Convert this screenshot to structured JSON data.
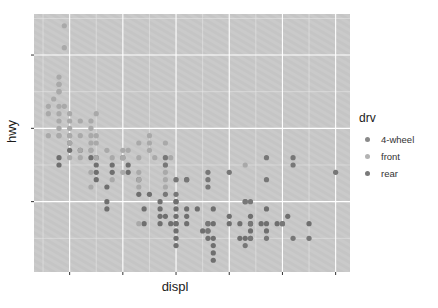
{
  "chart_data": {
    "type": "scatter",
    "title": "",
    "xlabel": "displ",
    "ylabel": "hwy",
    "xlim": [
      1.33,
      7.27
    ],
    "ylim": [
      10.4,
      45.6
    ],
    "x_major_breaks": [
      2,
      3,
      4,
      5,
      6,
      7
    ],
    "x_minor_breaks": [
      1.5,
      2.5,
      3.5,
      4.5,
      5.5,
      6.5
    ],
    "y_major_breaks": [
      20,
      30,
      40
    ],
    "y_minor_breaks": [
      15,
      25,
      35,
      45
    ],
    "tick_labels_visible": false,
    "grid": true,
    "legend_position": "right",
    "legend": {
      "title": "drv",
      "entries": [
        {
          "key": "4",
          "label": "4-wheel",
          "color": "#8a8a8a"
        },
        {
          "key": "f",
          "label": "front",
          "color": "#b3b3b3"
        },
        {
          "key": "r",
          "label": "rear",
          "color": "#7a7a7a"
        }
      ]
    },
    "point_colors": {
      "4": "#6f6f6f",
      "f": "#a9a9a9",
      "r": "#777777"
    },
    "series": [
      {
        "name": "4-wheel",
        "drv": "4",
        "points": [
          [
            1.8,
            26
          ],
          [
            1.8,
            25
          ],
          [
            2.0,
            28
          ],
          [
            2.0,
            27
          ],
          [
            2.8,
            25
          ],
          [
            3.1,
            25
          ],
          [
            2.8,
            24
          ],
          [
            3.1,
            24
          ],
          [
            4.2,
            23
          ],
          [
            5.3,
            20
          ],
          [
            5.3,
            15
          ],
          [
            5.7,
            17
          ],
          [
            6.5,
            17
          ],
          [
            3.7,
            19
          ],
          [
            3.7,
            18
          ],
          [
            3.9,
            17
          ],
          [
            4.7,
            17
          ],
          [
            4.7,
            19
          ],
          [
            5.2,
            17
          ],
          [
            5.7,
            19
          ],
          [
            5.9,
            17
          ],
          [
            4.7,
            12
          ],
          [
            5.2,
            15
          ],
          [
            3.7,
            17
          ],
          [
            4.0,
            17
          ],
          [
            4.7,
            15
          ],
          [
            5.7,
            16
          ],
          [
            6.1,
            18
          ],
          [
            4.6,
            17
          ],
          [
            5.4,
            17
          ],
          [
            5.4,
            15
          ],
          [
            4.0,
            20
          ],
          [
            4.0,
            19
          ],
          [
            4.6,
            15
          ],
          [
            5.0,
            17
          ],
          [
            4.2,
            17
          ],
          [
            4.2,
            19
          ],
          [
            4.6,
            16
          ],
          [
            5.4,
            16
          ],
          [
            2.4,
            26
          ],
          [
            3.0,
            26
          ],
          [
            3.3,
            21
          ],
          [
            3.3,
            23
          ],
          [
            4.2,
            18
          ],
          [
            4.4,
            19
          ],
          [
            5.0,
            18
          ],
          [
            5.4,
            18
          ],
          [
            2.5,
            26
          ],
          [
            2.5,
            25
          ],
          [
            2.5,
            24
          ],
          [
            2.5,
            23
          ],
          [
            2.2,
            27
          ],
          [
            2.7,
            20
          ],
          [
            2.7,
            19
          ],
          [
            3.4,
            17
          ],
          [
            4.0,
            20
          ],
          [
            2.7,
            22
          ],
          [
            3.4,
            19
          ],
          [
            4.0,
            18
          ],
          [
            4.0,
            17
          ],
          [
            3.5,
            21
          ],
          [
            3.8,
            18
          ],
          [
            3.7,
            20
          ],
          [
            4.5,
            16
          ],
          [
            5.6,
            17
          ],
          [
            4.0,
            15
          ],
          [
            4.7,
            14
          ],
          [
            4.7,
            13
          ],
          [
            4.0,
            16
          ],
          [
            4.0,
            14
          ]
        ]
      },
      {
        "name": "front",
        "drv": "f",
        "points": [
          [
            1.8,
            29
          ],
          [
            2.0,
            31
          ],
          [
            2.0,
            30
          ],
          [
            2.8,
            26
          ],
          [
            3.1,
            27
          ],
          [
            3.8,
            28
          ],
          [
            3.3,
            24
          ],
          [
            3.8,
            24
          ],
          [
            3.0,
            26
          ],
          [
            4.0,
            23
          ],
          [
            3.3,
            22
          ],
          [
            3.8,
            23
          ],
          [
            3.8,
            22
          ],
          [
            3.3,
            17
          ],
          [
            2.4,
            24
          ],
          [
            2.4,
            22
          ],
          [
            3.0,
            24
          ],
          [
            3.3,
            23
          ],
          [
            1.8,
            29
          ],
          [
            1.8,
            31
          ],
          [
            1.6,
            33
          ],
          [
            1.6,
            32
          ],
          [
            1.6,
            29
          ],
          [
            1.7,
            34
          ],
          [
            1.8,
            36
          ],
          [
            1.8,
            35
          ],
          [
            1.8,
            32
          ],
          [
            1.8,
            37
          ],
          [
            1.9,
            44
          ],
          [
            1.9,
            41
          ],
          [
            2.0,
            29
          ],
          [
            2.0,
            26
          ],
          [
            2.0,
            28
          ],
          [
            2.4,
            27
          ],
          [
            2.5,
            26
          ],
          [
            3.3,
            26
          ],
          [
            3.8,
            26
          ],
          [
            3.5,
            29
          ],
          [
            2.4,
            30
          ],
          [
            2.4,
            29
          ],
          [
            2.4,
            31
          ],
          [
            2.5,
            32
          ],
          [
            2.7,
            27
          ],
          [
            2.5,
            29
          ],
          [
            3.0,
            26
          ],
          [
            3.5,
            28
          ],
          [
            3.5,
            27
          ],
          [
            3.9,
            26
          ],
          [
            3.3,
            28
          ],
          [
            2.2,
            27
          ],
          [
            2.2,
            26
          ],
          [
            2.4,
            27
          ],
          [
            3.0,
            27
          ],
          [
            2.2,
            29
          ],
          [
            2.2,
            31
          ],
          [
            1.8,
            33
          ],
          [
            1.8,
            35
          ],
          [
            2.4,
            28
          ],
          [
            2.0,
            29
          ],
          [
            2.8,
            23
          ],
          [
            1.9,
            33
          ],
          [
            2.0,
            32
          ],
          [
            2.5,
            28
          ],
          [
            1.8,
            30
          ],
          [
            2.0,
            28
          ],
          [
            1.8,
            36
          ],
          [
            3.6,
            26
          ],
          [
            3.8,
            25
          ],
          [
            5.3,
            25
          ]
        ]
      },
      {
        "name": "rear",
        "drv": "r",
        "points": [
          [
            5.7,
            26
          ],
          [
            6.2,
            26
          ],
          [
            7.0,
            24
          ],
          [
            6.2,
            25
          ],
          [
            5.7,
            23
          ],
          [
            4.6,
            17
          ],
          [
            5.4,
            17
          ],
          [
            5.3,
            20
          ],
          [
            6.0,
            17
          ],
          [
            5.7,
            15
          ],
          [
            6.5,
            15
          ],
          [
            5.3,
            14
          ],
          [
            6.0,
            17
          ],
          [
            6.2,
            15
          ],
          [
            4.6,
            16
          ],
          [
            5.4,
            15
          ],
          [
            3.8,
            26
          ],
          [
            4.0,
            23
          ],
          [
            4.6,
            23
          ],
          [
            5.4,
            20
          ],
          [
            3.8,
            25
          ],
          [
            4.0,
            21
          ],
          [
            4.6,
            22
          ],
          [
            5.4,
            17
          ],
          [
            4.2,
            23
          ],
          [
            3.8,
            21
          ],
          [
            4.6,
            24
          ],
          [
            5.0,
            24
          ]
        ]
      }
    ]
  }
}
